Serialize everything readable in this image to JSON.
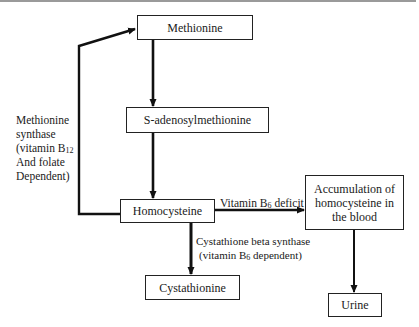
{
  "diagram": {
    "type": "flowchart",
    "topic": "Homocysteine metabolism",
    "nodes": [
      {
        "id": "methionine",
        "label": "Methionine"
      },
      {
        "id": "sam",
        "label": "S-adenosylmethionine"
      },
      {
        "id": "homocysteine",
        "label": "Homocysteine"
      },
      {
        "id": "cystathionine",
        "label": "Cystathionine"
      },
      {
        "id": "accumulation",
        "label_lines": [
          "Accumulation of",
          "homocysteine in",
          "the blood"
        ]
      },
      {
        "id": "urine",
        "label": "Urine"
      }
    ],
    "edges": [
      {
        "from": "methionine",
        "to": "sam"
      },
      {
        "from": "sam",
        "to": "homocysteine"
      },
      {
        "from": "homocysteine",
        "to": "methionine",
        "label_key": "methionine_synthase"
      },
      {
        "from": "homocysteine",
        "to": "accumulation",
        "label_key": "b6_deficit"
      },
      {
        "from": "homocysteine",
        "to": "cystathionine",
        "label_key": "cbs"
      },
      {
        "from": "accumulation",
        "to": "urine"
      }
    ],
    "edge_labels": {
      "methionine_synthase": {
        "line1": "Methionine",
        "line2": "synthase",
        "line3_prefix": "(vitamin B",
        "line3_sub": "12",
        "line4": "And folate",
        "line5": "Dependent)"
      },
      "b6_deficit": {
        "prefix": "Vitamin B",
        "sub": "6",
        "suffix": " deficit"
      },
      "cbs": {
        "line1": "Cystathione beta synthase",
        "line2_prefix": "(vitamin B",
        "line2_sub": "6",
        "line2_suffix": " dependent)"
      }
    },
    "colors": {
      "line": "#111111",
      "box_border": "#222222",
      "text": "#1a1a1a",
      "top_rule": "#9a9a9a"
    }
  }
}
